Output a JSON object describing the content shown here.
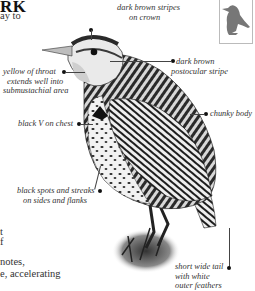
{
  "page": {
    "title_fragment": "RK",
    "body_lines": [
      {
        "text": "ay to",
        "top": 10
      },
      {
        "text": "t",
        "top": 227
      },
      {
        "text": "f",
        "top": 237
      },
      {
        "text": "notes,",
        "top": 257
      },
      {
        "text": "e, accelerating",
        "top": 269
      }
    ]
  },
  "illustration": {
    "subject": "meadowlark",
    "thumbnail_icon": "bird-silhouette-icon",
    "annotations": [
      {
        "id": "crown",
        "text_lines": [
          "dark brown stripes",
          "on crown"
        ]
      },
      {
        "id": "postocular",
        "text_lines": [
          "dark brown",
          "postocular stripe"
        ]
      },
      {
        "id": "throat",
        "text_lines": [
          "yellow of throat",
          "extends well into",
          "submustachial area"
        ]
      },
      {
        "id": "chest",
        "text_lines": [
          "black V on chest"
        ]
      },
      {
        "id": "body",
        "text_lines": [
          "chunky body"
        ]
      },
      {
        "id": "flanks",
        "text_lines": [
          "black spots and streaks",
          "on sides and flanks"
        ]
      },
      {
        "id": "tail",
        "text_lines": [
          "short wide tail",
          "with white",
          "outer feathers"
        ]
      }
    ]
  }
}
